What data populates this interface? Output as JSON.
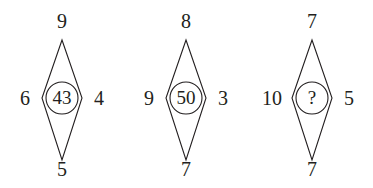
{
  "puzzle": {
    "type": "diamond-number-series",
    "stroke_color": "#231f20",
    "background_color": "#ffffff",
    "figures": [
      {
        "id": "figure-1",
        "top": "9",
        "left": "6",
        "right": "4",
        "bottom": "5",
        "center": "43",
        "center_is_unknown": false
      },
      {
        "id": "figure-2",
        "top": "8",
        "left": "9",
        "right": "3",
        "bottom": "7",
        "center": "50",
        "center_is_unknown": false
      },
      {
        "id": "figure-3",
        "top": "7",
        "left": "10",
        "right": "5",
        "bottom": "7",
        "center": "?",
        "center_is_unknown": true
      }
    ]
  }
}
